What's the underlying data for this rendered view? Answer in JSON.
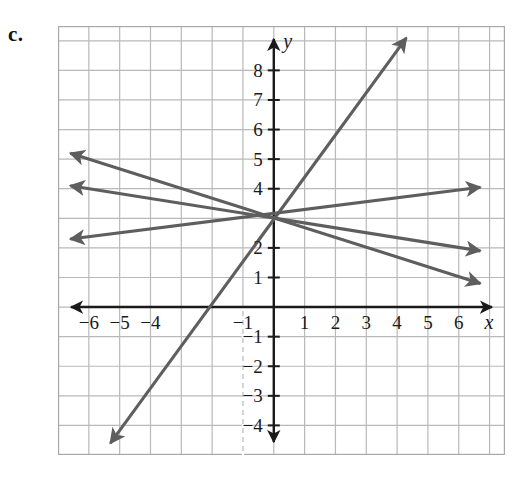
{
  "part_label": "c.",
  "axis_labels": {
    "x_axis_name": "x",
    "y_axis_name": "y"
  },
  "x_tick_labels": [
    {
      "value": -6,
      "text": "−6"
    },
    {
      "value": -5,
      "text": "−5"
    },
    {
      "value": -4,
      "text": "−4"
    },
    {
      "value": -1,
      "text": "−1"
    },
    {
      "value": 1,
      "text": "1"
    },
    {
      "value": 2,
      "text": "2"
    },
    {
      "value": 3,
      "text": "3"
    },
    {
      "value": 4,
      "text": "4"
    },
    {
      "value": 5,
      "text": "5"
    },
    {
      "value": 6,
      "text": "6"
    }
  ],
  "y_tick_labels": [
    {
      "value": 8,
      "text": "8"
    },
    {
      "value": 7,
      "text": "7"
    },
    {
      "value": 6,
      "text": "6"
    },
    {
      "value": 5,
      "text": "5"
    },
    {
      "value": 4,
      "text": "4"
    },
    {
      "value": 2,
      "text": "2"
    },
    {
      "value": 1,
      "text": "1"
    },
    {
      "value": -1,
      "text": "−1"
    },
    {
      "value": -2,
      "text": "−2"
    },
    {
      "value": -3,
      "text": "−3"
    },
    {
      "value": -4,
      "text": "−4"
    }
  ],
  "colors": {
    "line_color": "#5e5e5e",
    "grid_color": "#b9b9b9",
    "axis_color": "#1a1a1a",
    "border_color": "#a8a8a8",
    "background": "#ffffff",
    "text_color": "#1a1a1a"
  },
  "chart_data": {
    "type": "line",
    "title": "",
    "xlabel": "x",
    "ylabel": "y",
    "xlim": [
      -7.0,
      7.5
    ],
    "ylim": [
      -5.0,
      9.5
    ],
    "grid": true,
    "grid_step": 1,
    "legend": "none",
    "common_point": {
      "x": 0,
      "y": 3
    },
    "annotation": "Four lines intersecting at the common point (0, 3)",
    "series": [
      {
        "name": "steep-rising-line",
        "slope": 2,
        "intercept": 3,
        "equation": "y = 2x + 3",
        "x_start": -5.3,
        "y_start": -4.6,
        "x_end": 4.3,
        "y_end": 9.1,
        "arrow_start": true,
        "arrow_end": true
      },
      {
        "name": "shallow-rising-line",
        "slope": 0.1667,
        "intercept": 3,
        "equation": "y = (1/6)x + 3",
        "x_start": -6.6,
        "y_start": 2.3,
        "x_end": 6.7,
        "y_end": 4.05,
        "arrow_start": true,
        "arrow_end": true
      },
      {
        "name": "shallow-falling-line",
        "slope": -0.3333,
        "intercept": 3,
        "equation": "y = -(1/3)x + 3",
        "x_start": -6.6,
        "y_start": 5.2,
        "x_end": 6.7,
        "y_end": 0.8,
        "arrow_start": true,
        "arrow_end": true
      },
      {
        "name": "shallow-falling-line-2",
        "slope": -0.1667,
        "intercept": 3,
        "equation": "y = -(1/6)x + 3",
        "x_start": -6.6,
        "y_start": 4.1,
        "x_end": 6.7,
        "y_end": 1.9,
        "arrow_start": true,
        "arrow_end": true
      }
    ]
  }
}
